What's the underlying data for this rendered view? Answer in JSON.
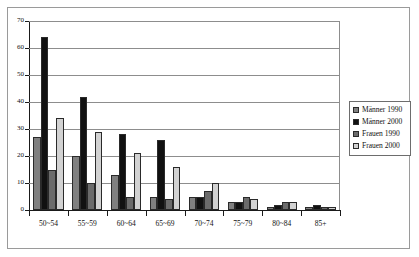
{
  "chart_data": {
    "type": "bar",
    "title": "",
    "xlabel": "",
    "ylabel": "",
    "ylim": [
      0,
      70
    ],
    "yticks": [
      0,
      10,
      20,
      30,
      40,
      50,
      60,
      70
    ],
    "grid": true,
    "legend_position": "right",
    "categories": [
      "50~54",
      "55~59",
      "60~64",
      "65~69",
      "70~74",
      "75~79",
      "80~84",
      "85+"
    ],
    "series": [
      {
        "name": "Männer 1990",
        "color": "#808080",
        "values": [
          27,
          20,
          13,
          5,
          5,
          3,
          1,
          1
        ]
      },
      {
        "name": "Männer 2000",
        "color": "#111111",
        "values": [
          64,
          42,
          28,
          26,
          5,
          3,
          2,
          2
        ]
      },
      {
        "name": "Frauen 1990",
        "color": "#6b6b6b",
        "values": [
          15,
          10,
          5,
          4,
          7,
          5,
          3,
          1
        ]
      },
      {
        "name": "Frauen 2000",
        "color": "#d2d2d2",
        "values": [
          34,
          29,
          21,
          16,
          10,
          4,
          3,
          1
        ]
      }
    ]
  }
}
